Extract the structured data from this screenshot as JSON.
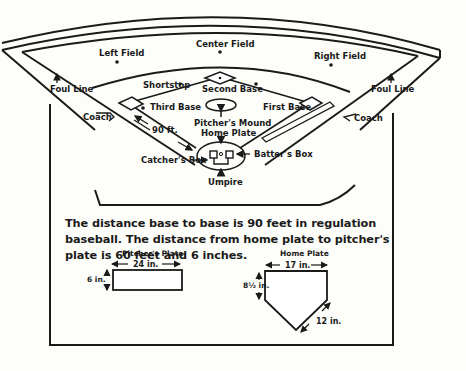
{
  "field": {
    "labels": {
      "left_field": "Left Field",
      "center_field": "Center Field",
      "right_field": "Right Field",
      "shortstop": "Shortstop",
      "second_base": "Second Base",
      "third_base": "Third Base",
      "first_base": "First Base",
      "pitchers_mound": "Pitcher's Mound",
      "home_plate": "Home Plate",
      "foul_line_left": "Foul Line",
      "foul_line_right": "Foul Line",
      "coach_left": "Coach",
      "coach_right": "Coach",
      "distance": "90 ft.",
      "catchers_box": "Catcher's Box",
      "batters_box": "Batter's Box",
      "umpire": "Umpire"
    }
  },
  "description": "The distance base to base is 90 feet in regulation baseball. The distance from home plate to pitcher's plate is 60 feet and 6 inches.",
  "pitchers_plate": {
    "title": "Pitcher's Plate",
    "width": "24 in.",
    "height": "6 in."
  },
  "home_plate_detail": {
    "title": "Home Plate",
    "width": "17 in.",
    "side": "8½ in.",
    "diagonal": "12 in."
  },
  "colors": {
    "ink": "#1a1a1a",
    "paper": "#fdfdf9"
  }
}
